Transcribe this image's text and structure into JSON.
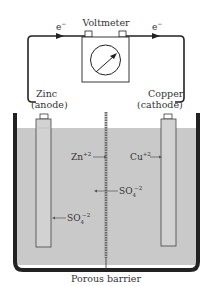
{
  "diagram": {
    "voltmeter_label": "Voltmeter",
    "electron_left": "e",
    "electron_right": "e",
    "electron_sup": "−",
    "anode": {
      "metal": "Zinc",
      "role": "(anode)"
    },
    "cathode": {
      "metal": "Copper",
      "role": "(cathode)"
    },
    "ions": {
      "zinc_ion": {
        "base": "Zn",
        "charge": "+2"
      },
      "copper_ion": {
        "base": "Cu",
        "charge": "+2"
      },
      "sulfate_center": {
        "base": "SO",
        "sub": "4",
        "charge": "−2"
      },
      "sulfate_left": {
        "base": "SO",
        "sub": "4",
        "charge": "−2"
      }
    },
    "barrier_label": "Porous barrier",
    "colors": {
      "solution": "#c9c9c9",
      "container": "#222222",
      "wire": "#222222",
      "electrode_fill": "#cfcfcf"
    }
  }
}
